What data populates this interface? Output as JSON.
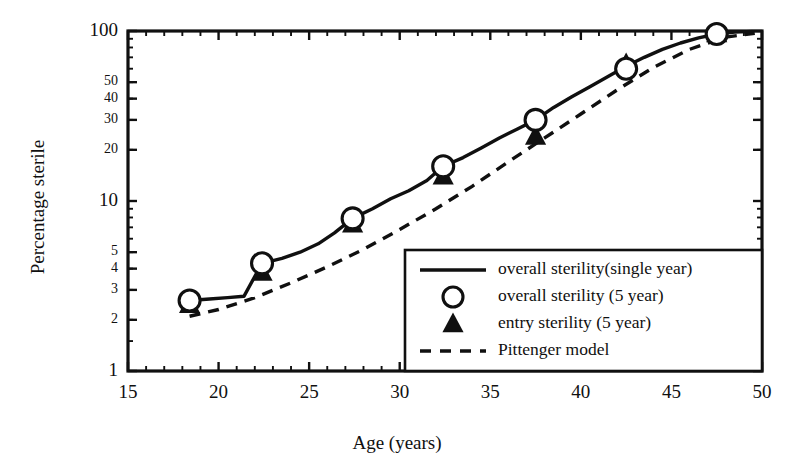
{
  "chart_data": {
    "type": "line",
    "title": "",
    "xlabel": "Age (years)",
    "ylabel": "Percentage sterile",
    "xlim": [
      15,
      50
    ],
    "ylim": [
      1,
      100
    ],
    "yscale": "log",
    "grid": false,
    "legend_position": "lower-right",
    "x_ticks": [
      15,
      20,
      25,
      30,
      35,
      40,
      45,
      50
    ],
    "x_tick_labels": [
      "15",
      "20",
      "25",
      "30",
      "35",
      "40",
      "45",
      "50"
    ],
    "y_ticks": [
      1,
      2,
      3,
      4,
      5,
      10,
      20,
      30,
      40,
      50,
      100
    ],
    "y_tick_labels": [
      "1",
      "2",
      "3",
      "4",
      "5",
      "10",
      "20",
      "30",
      "40",
      "50",
      "100"
    ],
    "y_minor_ticks": [
      1.5,
      6,
      7,
      8,
      9,
      15,
      25,
      35,
      45,
      60,
      70,
      80,
      90
    ],
    "series": [
      {
        "name": "overall sterility(single year)",
        "style": "solid-line",
        "x": [
          18.4,
          19.5,
          20.5,
          21.4,
          22.4,
          23.5,
          24.5,
          25.5,
          26.4,
          27.4,
          28.5,
          29.5,
          30.5,
          31.5,
          32.4,
          33.5,
          34.5,
          35.5,
          36.5,
          37.5,
          38.5,
          39.5,
          40.5,
          41.5,
          42.5,
          43.5,
          44.5,
          45.5,
          46.5,
          47.5,
          48.5,
          49.5
        ],
        "y": [
          2.6,
          2.65,
          2.7,
          2.75,
          4.3,
          4.6,
          5.0,
          5.6,
          6.5,
          7.9,
          9.0,
          10.3,
          11.5,
          13.2,
          16.0,
          18.0,
          20.5,
          23.5,
          26.5,
          30.0,
          35.5,
          41.0,
          47.0,
          54.0,
          62.0,
          70.0,
          78.0,
          85.0,
          91.0,
          96.0,
          98.5,
          99.5
        ]
      },
      {
        "name": "overall sterility (5 year)",
        "style": "open-circle-marker",
        "x": [
          18.4,
          22.4,
          27.4,
          32.4,
          37.5,
          42.5,
          47.5
        ],
        "y": [
          2.6,
          4.3,
          7.9,
          16.0,
          30.0,
          60.0,
          96.0
        ]
      },
      {
        "name": "entry sterility (5 year)",
        "style": "filled-triangle-marker",
        "x": [
          18.4,
          22.4,
          27.4,
          32.4,
          37.5,
          42.5,
          47.5
        ],
        "y": [
          2.45,
          3.8,
          7.3,
          14.0,
          24.0,
          64.0,
          96.0
        ]
      },
      {
        "name": "Pittenger model",
        "style": "dashed-line",
        "x": [
          18.4,
          20.0,
          22.0,
          24.0,
          26.0,
          28.0,
          30.0,
          32.0,
          34.0,
          36.0,
          38.0,
          40.0,
          42.0,
          44.0,
          46.0,
          48.0,
          49.6
        ],
        "y": [
          2.1,
          2.3,
          2.7,
          3.3,
          4.1,
          5.2,
          6.8,
          9.0,
          12.2,
          17.0,
          23.5,
          32.5,
          45.0,
          61.0,
          78.0,
          92.0,
          97.0
        ]
      }
    ],
    "legend_entries": [
      {
        "label": "overall sterility(single year)",
        "marker": "solid-line"
      },
      {
        "label": "overall sterility (5 year)",
        "marker": "open-circle"
      },
      {
        "label": "entry sterility (5 year)",
        "marker": "filled-triangle"
      },
      {
        "label": "Pittenger model",
        "marker": "dashed-line"
      }
    ]
  }
}
